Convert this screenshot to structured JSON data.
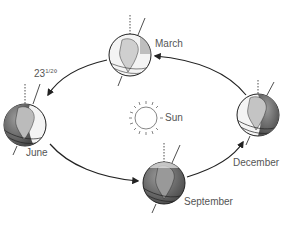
{
  "diagram": {
    "center_label": "Sun",
    "tilt_label": "23",
    "tilt_fraction": "1/2",
    "tilt_unit": "°",
    "orbit_direction": "counterclockwise (March → June → September → December → March)",
    "positions": [
      {
        "id": "march",
        "label": "March"
      },
      {
        "id": "june",
        "label": "June"
      },
      {
        "id": "september",
        "label": "September"
      },
      {
        "id": "december",
        "label": "December"
      }
    ],
    "colors": {
      "line": "#222222",
      "text": "#555555",
      "globe_dark": "#6f6f6f",
      "globe_light": "#f2f2f2"
    }
  }
}
